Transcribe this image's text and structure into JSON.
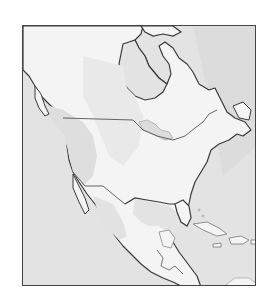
{
  "map": {
    "region": "North America",
    "style": "grayscale physical outline map",
    "labels": [],
    "colors": {
      "background": "#ffffff",
      "ocean": "#e3e3e3",
      "land": "#f4f4f4",
      "highland": "#d9d9d9",
      "coastline": "#3a3a3a",
      "border": "#555555",
      "frame": "#444444"
    },
    "features": [
      "Canada",
      "United States",
      "Mexico",
      "Greenland (partial)",
      "Central America",
      "Caribbean islands",
      "Great Lakes",
      "Hudson Bay"
    ]
  }
}
